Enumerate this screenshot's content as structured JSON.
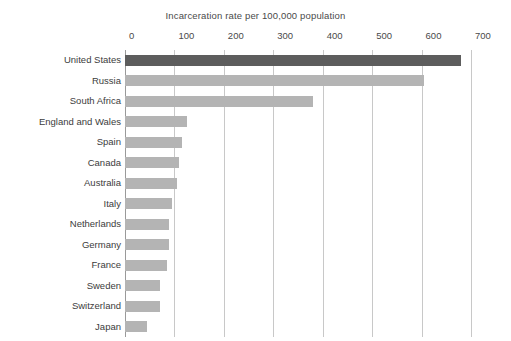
{
  "chart_data": {
    "type": "bar",
    "orientation": "horizontal",
    "title": "Incarceration rate per 100,000 population",
    "xlabel": "",
    "ylabel": "",
    "xlim": [
      0,
      700
    ],
    "xticks": [
      0,
      100,
      200,
      300,
      400,
      500,
      600,
      700
    ],
    "grid": "vertical",
    "legend": "none",
    "categories": [
      "United States",
      "Russia",
      "South Africa",
      "England and Wales",
      "Spain",
      "Canada",
      "Australia",
      "Italy",
      "Netherlands",
      "Germany",
      "France",
      "Sweden",
      "Switzerland",
      "Japan"
    ],
    "values": [
      680,
      605,
      380,
      125,
      115,
      110,
      105,
      95,
      90,
      90,
      85,
      70,
      70,
      45
    ],
    "bar_colors": [
      "#5d5d5d",
      "#b4b4b4",
      "#b4b4b4",
      "#b4b4b4",
      "#b4b4b4",
      "#b4b4b4",
      "#b4b4b4",
      "#b4b4b4",
      "#b4b4b4",
      "#b4b4b4",
      "#b4b4b4",
      "#b4b4b4",
      "#b4b4b4",
      "#b4b4b4"
    ],
    "highlight_category": "United States",
    "colors": {
      "highlight_bar": "#5d5d5d",
      "bar": "#b4b4b4",
      "gridline": "#c8c8c8",
      "axis": "#9a9a9a",
      "text": "#3c3c3c",
      "background": "#ffffff"
    }
  }
}
